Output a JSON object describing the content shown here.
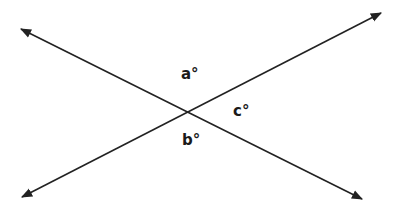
{
  "diagram": {
    "type": "intersecting-lines",
    "line_color": "#222222",
    "lines": [
      {
        "name": "line-1",
        "x1": 21,
        "y1": 29,
        "x2": 362,
        "y2": 199
      },
      {
        "name": "line-2",
        "x1": 22,
        "y1": 197,
        "x2": 381,
        "y2": 13
      }
    ],
    "intersection": {
      "x": 187,
      "y": 111
    },
    "labels": [
      {
        "id": "a",
        "text": "a°",
        "x": 181,
        "y": 79
      },
      {
        "id": "c",
        "text": "c°",
        "x": 233,
        "y": 116
      },
      {
        "id": "b",
        "text": "b°",
        "x": 182,
        "y": 145
      }
    ]
  }
}
